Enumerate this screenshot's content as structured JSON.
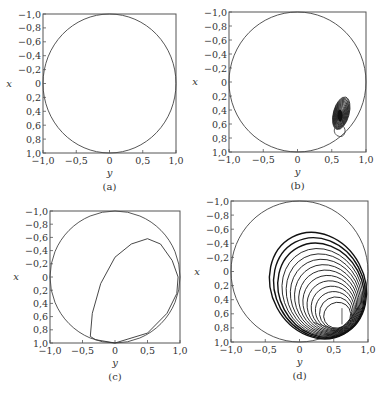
{
  "figure": {
    "panels": [
      {
        "id": "a",
        "caption": "(a)",
        "box": {
          "left": 43,
          "top": 14,
          "right": 176,
          "bottom": 153
        },
        "xlabel": "y",
        "ylabel": "x",
        "xticks": [
          "-1.0",
          "-0.5",
          "0",
          "0.5",
          "1.0"
        ],
        "yticks": [
          "-1.0",
          "-0.8",
          "-0.6",
          "-0.4",
          "-0.2",
          "0",
          "0.2",
          "0.4",
          "0.6",
          "0.8",
          "1.0"
        ],
        "description": "unit circle only"
      },
      {
        "id": "b",
        "caption": "(b)",
        "box": {
          "left": 229,
          "top": 12,
          "right": 366,
          "bottom": 152
        },
        "xlabel": "y",
        "ylabel": "x",
        "xticks": [
          "-1.0",
          "-0.5",
          "0",
          "0.5",
          "1.0"
        ],
        "yticks": [
          "-1.0",
          "-0.8",
          "-0.6",
          "-0.4",
          "-0.2",
          "0",
          "0.2",
          "0.4",
          "0.6",
          "0.8",
          "1.0"
        ],
        "description": "unit circle with small dense spiral trajectory near (y=0.62, x=0.5)"
      },
      {
        "id": "c",
        "caption": "(c)",
        "box": {
          "left": 50,
          "top": 211,
          "right": 180,
          "bottom": 343
        },
        "xlabel": "y",
        "ylabel": "x",
        "xticks": [
          "-1.0",
          "-0.5",
          "0",
          "0.5",
          "1.0"
        ],
        "yticks": [
          "-1.0",
          "-0.8",
          "-0.6",
          "-0.4",
          "-0.2",
          "0",
          "0.2",
          "0.4",
          "0.6",
          "0.8",
          "1.0"
        ],
        "description": "unit circle with single closed loop trajectory"
      },
      {
        "id": "d",
        "caption": "(d)",
        "box": {
          "left": 231,
          "top": 201,
          "right": 368,
          "bottom": 342
        },
        "xlabel": "y",
        "ylabel": "x",
        "xticks": [
          "-1.0",
          "-0.5",
          "0",
          "0.5",
          "1.0"
        ],
        "yticks": [
          "-1.0",
          "-0.8",
          "-0.6",
          "-0.4",
          "-0.2",
          "0",
          "0.2",
          "0.4",
          "0.6",
          "0.8",
          "1.0"
        ],
        "description": "unit circle with many nested spiraling trajectory loops converging to outer loop"
      }
    ]
  },
  "chart_data": [
    {
      "type": "line",
      "title": "(a)",
      "xlabel": "y",
      "ylabel": "x",
      "xlim": [
        -1.0,
        1.0
      ],
      "ylim": [
        -1.0,
        1.0
      ],
      "y_inverted": true,
      "xticks": [
        -1.0,
        -0.5,
        0,
        0.5,
        1.0
      ],
      "yticks": [
        -1.0,
        -0.8,
        -0.6,
        -0.4,
        -0.2,
        0,
        0.2,
        0.4,
        0.6,
        0.8,
        1.0
      ],
      "grid": false,
      "series": [
        {
          "name": "unit circle",
          "shape": "circle",
          "center": [
            0,
            0
          ],
          "radius": 1.0
        }
      ]
    },
    {
      "type": "line",
      "title": "(b)",
      "xlabel": "y",
      "ylabel": "x",
      "xlim": [
        -1.0,
        1.0
      ],
      "ylim": [
        -1.0,
        1.0
      ],
      "y_inverted": true,
      "xticks": [
        -1.0,
        -0.5,
        0,
        0.5,
        1.0
      ],
      "yticks": [
        -1.0,
        -0.8,
        -0.6,
        -0.4,
        -0.2,
        0,
        0.2,
        0.4,
        0.6,
        0.8,
        1.0
      ],
      "grid": false,
      "series": [
        {
          "name": "unit circle",
          "shape": "circle",
          "center": [
            0,
            0
          ],
          "radius": 1.0
        },
        {
          "name": "trajectory",
          "shape": "spiral-cluster",
          "center": [
            0.62,
            0.48
          ],
          "extent_y": [
            0.52,
            0.72
          ],
          "extent_x": [
            0.32,
            0.72
          ]
        }
      ]
    },
    {
      "type": "line",
      "title": "(c)",
      "xlabel": "y",
      "ylabel": "x",
      "xlim": [
        -1.0,
        1.0
      ],
      "ylim": [
        -1.0,
        1.0
      ],
      "y_inverted": true,
      "xticks": [
        -1.0,
        -0.5,
        0,
        0.5,
        1.0
      ],
      "yticks": [
        -1.0,
        -0.8,
        -0.6,
        -0.4,
        -0.2,
        0,
        0.2,
        0.4,
        0.6,
        0.8,
        1.0
      ],
      "grid": false,
      "series": [
        {
          "name": "unit circle",
          "shape": "circle",
          "center": [
            0,
            0
          ],
          "radius": 1.0
        },
        {
          "name": "limit cycle",
          "points": [
            [
              -0.38,
              0.9
            ],
            [
              -0.35,
              0.55
            ],
            [
              -0.22,
              0.1
            ],
            [
              0.0,
              -0.3
            ],
            [
              0.25,
              -0.5
            ],
            [
              0.5,
              -0.58
            ],
            [
              0.7,
              -0.5
            ],
            [
              0.88,
              -0.25
            ],
            [
              0.97,
              0.0
            ],
            [
              0.95,
              0.25
            ],
            [
              0.8,
              0.55
            ],
            [
              0.5,
              0.85
            ],
            [
              0.0,
              1.0
            ],
            [
              -0.3,
              0.95
            ],
            [
              -0.38,
              0.9
            ]
          ]
        }
      ]
    },
    {
      "type": "line",
      "title": "(d)",
      "xlabel": "y",
      "ylabel": "x",
      "xlim": [
        -1.0,
        1.0
      ],
      "ylim": [
        -1.0,
        1.0
      ],
      "y_inverted": true,
      "xticks": [
        -1.0,
        -0.5,
        0,
        0.5,
        1.0
      ],
      "yticks": [
        -1.0,
        -0.8,
        -0.6,
        -0.4,
        -0.2,
        0,
        0.2,
        0.4,
        0.6,
        0.8,
        1.0
      ],
      "grid": false,
      "series": [
        {
          "name": "unit circle",
          "shape": "circle",
          "center": [
            0,
            0
          ],
          "radius": 1.0
        },
        {
          "name": "spiral trajectory",
          "start": [
            0.62,
            0.55
          ],
          "converges_to": "outer loop from y=-0.45..0.95, x=-0.58..1.0",
          "loops": 14
        }
      ]
    }
  ]
}
